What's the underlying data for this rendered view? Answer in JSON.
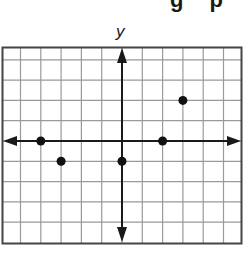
{
  "header": {
    "partial_text": "g p"
  },
  "graph": {
    "y_axis_label": "y",
    "grid": {
      "x_min": -6,
      "x_max": 6,
      "y_min": -5,
      "y_max": 5,
      "cell_px": 20.3,
      "origin_px": [
        122,
        141
      ],
      "line_color": "#9a9a9a",
      "border_color": "#444444",
      "axis_color": "#1a1a1a"
    },
    "points": [
      {
        "x": -4,
        "y": 0
      },
      {
        "x": -3,
        "y": -1
      },
      {
        "x": 0,
        "y": -1
      },
      {
        "x": 2,
        "y": 0
      },
      {
        "x": 3,
        "y": 2
      }
    ]
  },
  "chart_data": {
    "type": "scatter",
    "title": "",
    "xlabel": "",
    "ylabel": "y",
    "x": [
      -4,
      -3,
      0,
      2,
      3
    ],
    "y": [
      0,
      -1,
      -1,
      0,
      2
    ],
    "series": [
      {
        "name": "points",
        "values": [
          [
            -4,
            0
          ],
          [
            -3,
            -1
          ],
          [
            0,
            -1
          ],
          [
            2,
            0
          ],
          [
            3,
            2
          ]
        ]
      }
    ],
    "xlim": [
      -6,
      6
    ],
    "ylim": [
      -5,
      5
    ],
    "grid": true,
    "legend": "none"
  }
}
